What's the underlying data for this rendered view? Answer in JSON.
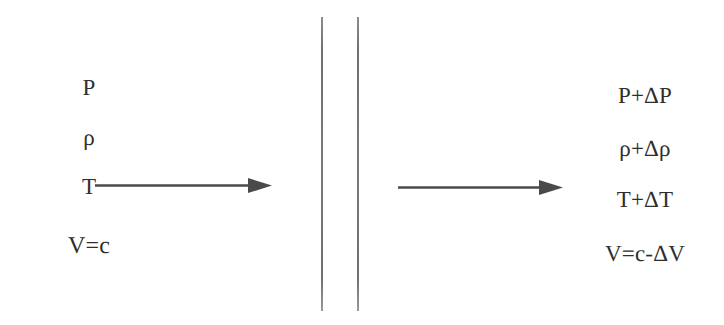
{
  "diagram": {
    "background_color": "#ffffff",
    "ink_color": "#2e2e2e",
    "line_color": "#7a7a7a",
    "upstream": {
      "region_label": "upstream properties",
      "items": [
        {
          "symbol": "P",
          "name": "pressure"
        },
        {
          "symbol": "ρ",
          "name": "density"
        },
        {
          "symbol": "T",
          "name": "temperature"
        },
        {
          "symbol": "V=c",
          "name": "velocity"
        }
      ]
    },
    "downstream": {
      "region_label": "downstream properties",
      "items": [
        {
          "symbol": "P+ΔP",
          "name": "pressure"
        },
        {
          "symbol": "ρ+Δρ",
          "name": "density"
        },
        {
          "symbol": "T+ΔT",
          "name": "temperature"
        },
        {
          "symbol": "V=c-ΔV",
          "name": "velocity"
        }
      ]
    },
    "wave_front": {
      "name": "wave front",
      "line_count": 2,
      "line_x_positions": [
        321,
        357
      ],
      "line_top": 17,
      "line_bottom": 311
    },
    "arrows": [
      {
        "name": "upstream-flow-arrow",
        "direction": "right",
        "x_start": 95,
        "x_end": 268,
        "y": 185
      },
      {
        "name": "downstream-flow-arrow",
        "direction": "right",
        "x_start": 398,
        "x_end": 560,
        "y": 187
      }
    ]
  }
}
